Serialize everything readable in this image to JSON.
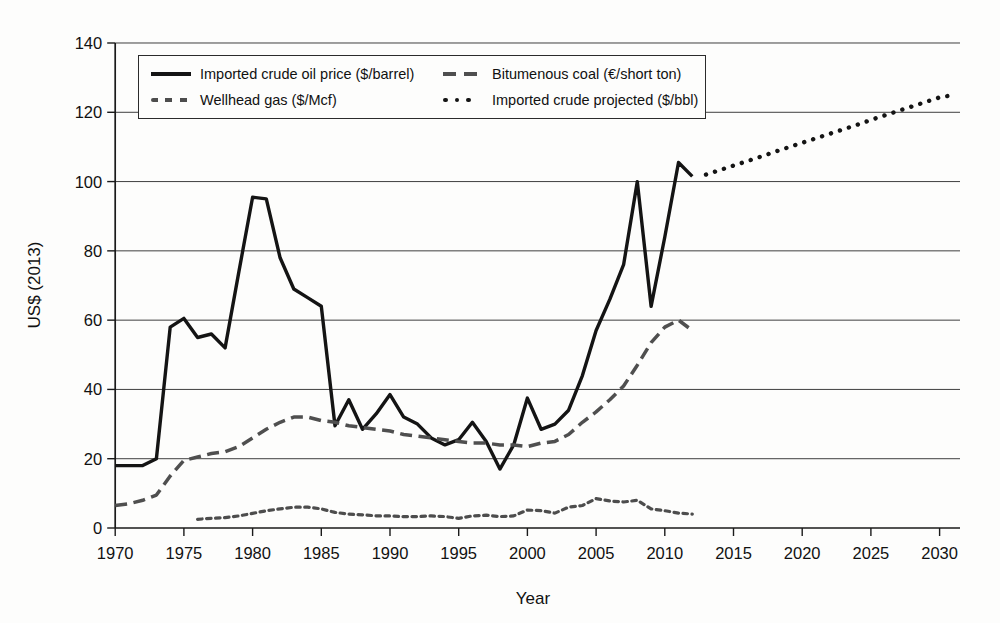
{
  "chart_data": {
    "type": "line",
    "title": "",
    "xlabel": "Year",
    "ylabel": "US$ (2013)",
    "xlim": [
      1970,
      2031.5
    ],
    "ylim": [
      0,
      140
    ],
    "xticks": [
      1970,
      1975,
      1980,
      1985,
      1990,
      1995,
      2000,
      2005,
      2010,
      2015,
      2020,
      2025,
      2030
    ],
    "yticks": [
      0,
      20,
      40,
      60,
      80,
      100,
      120,
      140
    ],
    "grid": "horizontal",
    "legend_position": "top-left-box",
    "axis_color": "#1a1a1a",
    "gridline_color": "#3f3f3f",
    "series": [
      {
        "name": "imported-crude-oil",
        "label": "Imported crude oil price ($/barrel)",
        "style": "solid",
        "color": "#141414",
        "points": [
          [
            1970,
            18
          ],
          [
            1971,
            18
          ],
          [
            1972,
            18
          ],
          [
            1973,
            20
          ],
          [
            1974,
            58
          ],
          [
            1975,
            60.5
          ],
          [
            1976,
            55
          ],
          [
            1977,
            56
          ],
          [
            1978,
            52
          ],
          [
            1979,
            74
          ],
          [
            1980,
            95.5
          ],
          [
            1981,
            95
          ],
          [
            1982,
            78
          ],
          [
            1983,
            69
          ],
          [
            1984,
            66.5
          ],
          [
            1985,
            64
          ],
          [
            1986,
            29.5
          ],
          [
            1987,
            37
          ],
          [
            1988,
            28.5
          ],
          [
            1989,
            33
          ],
          [
            1990,
            38.5
          ],
          [
            1991,
            32
          ],
          [
            1992,
            30
          ],
          [
            1993,
            26
          ],
          [
            1994,
            24
          ],
          [
            1995,
            25.5
          ],
          [
            1996,
            30.5
          ],
          [
            1997,
            25
          ],
          [
            1998,
            17
          ],
          [
            1999,
            24
          ],
          [
            2000,
            37.5
          ],
          [
            2001,
            28.5
          ],
          [
            2002,
            30
          ],
          [
            2003,
            34
          ],
          [
            2004,
            44
          ],
          [
            2005,
            57
          ],
          [
            2006,
            66
          ],
          [
            2007,
            76
          ],
          [
            2008,
            100
          ],
          [
            2009,
            64
          ],
          [
            2010,
            84
          ],
          [
            2011,
            105.5
          ],
          [
            2012,
            101.5
          ]
        ]
      },
      {
        "name": "bituminous-coal",
        "label": "Bitumenous coal (€/short ton)",
        "style": "long-dash",
        "color": "#4f4f4f",
        "points": [
          [
            1970,
            6.5
          ],
          [
            1971,
            7
          ],
          [
            1972,
            8
          ],
          [
            1973,
            9.5
          ],
          [
            1974,
            15
          ],
          [
            1975,
            19.5
          ],
          [
            1976,
            20.5
          ],
          [
            1977,
            21.5
          ],
          [
            1978,
            22
          ],
          [
            1979,
            23.5
          ],
          [
            1980,
            26
          ],
          [
            1981,
            28.5
          ],
          [
            1982,
            30.5
          ],
          [
            1983,
            32
          ],
          [
            1984,
            32
          ],
          [
            1985,
            31
          ],
          [
            1986,
            30.5
          ],
          [
            1987,
            29.5
          ],
          [
            1988,
            29
          ],
          [
            1989,
            28.5
          ],
          [
            1990,
            28
          ],
          [
            1991,
            27
          ],
          [
            1992,
            26.5
          ],
          [
            1993,
            26
          ],
          [
            1994,
            25.5
          ],
          [
            1995,
            25
          ],
          [
            1996,
            24.5
          ],
          [
            1997,
            24.5
          ],
          [
            1998,
            24
          ],
          [
            1999,
            24
          ],
          [
            2000,
            23.5
          ],
          [
            2001,
            24.5
          ],
          [
            2002,
            25
          ],
          [
            2003,
            27
          ],
          [
            2004,
            30.5
          ],
          [
            2005,
            33.5
          ],
          [
            2006,
            37
          ],
          [
            2007,
            41
          ],
          [
            2008,
            47
          ],
          [
            2009,
            53.5
          ],
          [
            2010,
            58
          ],
          [
            2011,
            60
          ],
          [
            2012,
            57
          ]
        ]
      },
      {
        "name": "wellhead-gas",
        "label": "Wellhead gas ($/Mcf)",
        "style": "short-dash",
        "color": "#4d4d4d",
        "points": [
          [
            1976,
            2.5
          ],
          [
            1977,
            2.8
          ],
          [
            1978,
            3
          ],
          [
            1979,
            3.5
          ],
          [
            1980,
            4.2
          ],
          [
            1981,
            5
          ],
          [
            1982,
            5.5
          ],
          [
            1983,
            6
          ],
          [
            1984,
            6
          ],
          [
            1985,
            5.5
          ],
          [
            1986,
            4.5
          ],
          [
            1987,
            4
          ],
          [
            1988,
            3.8
          ],
          [
            1989,
            3.5
          ],
          [
            1990,
            3.5
          ],
          [
            1991,
            3.3
          ],
          [
            1992,
            3.3
          ],
          [
            1993,
            3.5
          ],
          [
            1994,
            3.3
          ],
          [
            1995,
            2.8
          ],
          [
            1996,
            3.5
          ],
          [
            1997,
            3.7
          ],
          [
            1998,
            3.3
          ],
          [
            1999,
            3.5
          ],
          [
            2000,
            5.2
          ],
          [
            2001,
            5
          ],
          [
            2002,
            4.3
          ],
          [
            2003,
            6
          ],
          [
            2004,
            6.5
          ],
          [
            2005,
            8.5
          ],
          [
            2006,
            7.8
          ],
          [
            2007,
            7.5
          ],
          [
            2008,
            8
          ],
          [
            2009,
            5.5
          ],
          [
            2010,
            5
          ],
          [
            2011,
            4.3
          ],
          [
            2012,
            4
          ]
        ]
      },
      {
        "name": "imported-crude-projected",
        "label": "Imported crude projected ($/bbl)",
        "style": "dotted",
        "color": "#141414",
        "points": [
          [
            2013,
            102
          ],
          [
            2014,
            103.3
          ],
          [
            2015,
            104.6
          ],
          [
            2016,
            105.9
          ],
          [
            2017,
            107.2
          ],
          [
            2018,
            108.6
          ],
          [
            2019,
            109.9
          ],
          [
            2020,
            111.2
          ],
          [
            2021,
            112.5
          ],
          [
            2022,
            113.8
          ],
          [
            2023,
            115.1
          ],
          [
            2024,
            116.4
          ],
          [
            2025,
            117.8
          ],
          [
            2026,
            119.1
          ],
          [
            2027,
            120.4
          ],
          [
            2028,
            121.7
          ],
          [
            2029,
            123
          ],
          [
            2030,
            124.3
          ],
          [
            2031,
            125
          ]
        ]
      }
    ]
  }
}
